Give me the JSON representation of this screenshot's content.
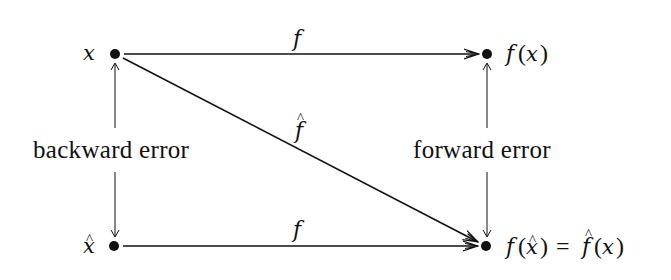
{
  "diagram": {
    "colors": {
      "ink": "#111111",
      "background": "#ffffff"
    },
    "nodes": [
      {
        "id": "x",
        "label": "x",
        "label_side": "left",
        "cx": 115,
        "cy": 54
      },
      {
        "id": "fx",
        "label": "f(x)",
        "label_side": "right",
        "cx": 487,
        "cy": 54
      },
      {
        "id": "xhat",
        "label": "x̂",
        "label_side": "left",
        "cx": 114,
        "cy": 246
      },
      {
        "id": "fxhat",
        "label": "f(x̂) = f̂(x)",
        "label_side": "right",
        "cx": 486,
        "cy": 246
      }
    ],
    "edges": [
      {
        "from": "x",
        "to": "fx",
        "label": "f"
      },
      {
        "from": "x",
        "to": "fxhat",
        "label": "f̂"
      },
      {
        "from": "xhat",
        "to": "fxhat",
        "label": "f"
      }
    ],
    "annotations": {
      "backward_error": "backward error",
      "forward_error": "forward error"
    },
    "labels": {
      "x": "x",
      "fx_f": "f",
      "fx_paren_open": "(",
      "fx_x": "x",
      "fx_paren_close": ")",
      "xhat": "x",
      "hat": "^",
      "edge_top": "f",
      "edge_diag": "f",
      "edge_bottom": "f",
      "res_f1": "f",
      "res_open1": "(",
      "res_x1": "x",
      "res_close1": ")",
      "res_eq": "=",
      "res_f2": "f",
      "res_open2": "(",
      "res_x2": "x",
      "res_close2": ")"
    }
  }
}
